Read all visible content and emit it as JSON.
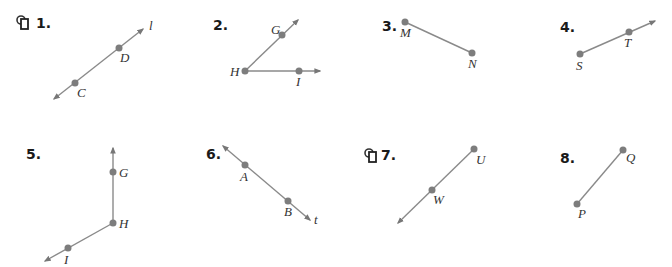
{
  "colors": {
    "line": "#8a8a8a",
    "point": "#7d7d7d",
    "text": "#1a1a1a"
  },
  "problems": [
    {
      "number": "1.",
      "has_icon": true,
      "labels": {
        "line": "l",
        "p1": "D",
        "p2": "C"
      }
    },
    {
      "number": "2.",
      "has_icon": false,
      "labels": {
        "p1": "G",
        "p2": "H",
        "p3": "I"
      }
    },
    {
      "number": "3.",
      "has_icon": false,
      "labels": {
        "p1": "M",
        "p2": "N"
      }
    },
    {
      "number": "4.",
      "has_icon": false,
      "labels": {
        "p1": "S",
        "p2": "T"
      }
    },
    {
      "number": "5.",
      "has_icon": false,
      "labels": {
        "p1": "G",
        "p2": "H",
        "p3": "I"
      }
    },
    {
      "number": "6.",
      "has_icon": false,
      "labels": {
        "p1": "A",
        "p2": "B",
        "line": "t"
      }
    },
    {
      "number": "7.",
      "has_icon": true,
      "labels": {
        "p1": "U",
        "p2": "W"
      }
    },
    {
      "number": "8.",
      "has_icon": false,
      "labels": {
        "p1": "Q",
        "p2": "P"
      }
    }
  ]
}
